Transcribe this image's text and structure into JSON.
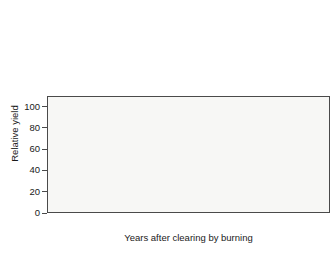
{
  "chart_data": {
    "type": "bar",
    "title": "",
    "xlabel": "Years after clearing by burning",
    "ylabel": "Relative yield",
    "ylim": [
      0,
      110
    ],
    "yticks": [
      0,
      20,
      40,
      60,
      80,
      100
    ],
    "ytick_labels": [
      "0",
      "20",
      "40",
      "60",
      "80",
      "100"
    ],
    "grid": false,
    "legend": "none",
    "groups": [
      {
        "label_line1": "Cotton",
        "label_line2": "(Southern Sudan)",
        "shade": "dark",
        "categories": [
          "1",
          "2",
          "3",
          "4"
        ],
        "values": [
          100,
          88,
          58,
          44
        ]
      },
      {
        "label_line1": "Maize",
        "label_line2": "(Honduras)",
        "shade": "dark",
        "categories": [
          "1",
          "2",
          "3"
        ],
        "values": [
          100,
          79,
          55
        ]
      },
      {
        "label_line1": "Manioc",
        "label_line2": "(Zaire)",
        "shade": "dark",
        "categories": [
          "1",
          "2"
        ],
        "values": [
          100,
          68
        ]
      },
      {
        "label_line1": "Rice",
        "label_line2": "(Malaysia)",
        "shade": "dark",
        "categories": [
          "1",
          "2",
          "3"
        ],
        "values": [
          100,
          68,
          47
        ]
      },
      {
        "label_line1": "Maize",
        "label_line2": "(Guatemala)",
        "shade": "light",
        "categories": [
          "1",
          "2"
        ],
        "values": [
          100,
          52
        ]
      },
      {
        "label_line1": "Rice",
        "label_line2": "(Zaire)",
        "shade": "dark",
        "categories": [
          "1",
          "2"
        ],
        "values": [
          100,
          27
        ]
      },
      {
        "label_line1": "Groundnut",
        "label_line2": "(Zaire)",
        "shade": "light",
        "categories": [
          "1",
          "2"
        ],
        "values": [
          100,
          17
        ]
      }
    ],
    "colors": {
      "bar_dark": "#6e6e6e",
      "bar_light": "#b3b3b3",
      "bar_edge": "#4f4f4f",
      "plot_background": "#f7f7f5",
      "axis": "#4a4a4a",
      "text": "#1a1a1a",
      "page_background": "#ffffff"
    }
  }
}
